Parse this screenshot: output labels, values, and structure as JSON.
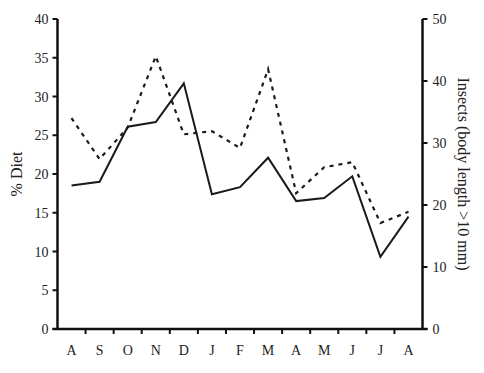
{
  "chart_data": {
    "type": "line",
    "title": "",
    "xlabel": "",
    "ylabel": "% Diet",
    "ylabel_right": "Insects (body length >10 mm)",
    "categories": [
      "A",
      "S",
      "O",
      "N",
      "D",
      "J",
      "F",
      "M",
      "A",
      "M",
      "J",
      "J",
      "A"
    ],
    "ylim": [
      0,
      40
    ],
    "ylim_right": [
      0,
      50
    ],
    "yticks": [
      0,
      5,
      10,
      15,
      20,
      25,
      30,
      35,
      40
    ],
    "yticks_right": [
      0,
      10,
      20,
      30,
      40,
      50
    ],
    "grid": false,
    "legend": null,
    "series": [
      {
        "name": "% Diet",
        "axis": "left",
        "style": "solid",
        "color": "#1a1a1a",
        "values": [
          18.5,
          19.0,
          26.1,
          26.7,
          31.7,
          17.4,
          18.3,
          22.1,
          16.5,
          16.9,
          19.7,
          9.3,
          14.5
        ]
      },
      {
        "name": "Insects (body length >10 mm)",
        "axis": "right",
        "style": "dashed",
        "color": "#1a1a1a",
        "values": [
          34.0,
          27.4,
          32.5,
          44.0,
          31.4,
          31.9,
          29.2,
          41.9,
          21.9,
          26.1,
          26.9,
          17.1,
          18.9
        ]
      }
    ]
  }
}
